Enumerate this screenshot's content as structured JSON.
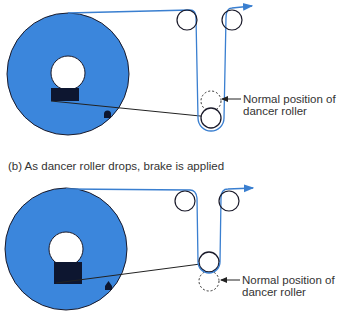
{
  "colors": {
    "reel_fill": "#3b86dc",
    "web_line": "#3a7fd0",
    "outline": "#1a1a2a",
    "brake_block": "#0d1630"
  },
  "panel_a": {
    "dancer_label_line1": "Normal position of",
    "dancer_label_line2": "dancer roller",
    "state": "dancer roller raised above normal position"
  },
  "panel_b": {
    "caption": "(b) As dancer roller drops, brake is applied",
    "dancer_label_line1": "Normal position of",
    "dancer_label_line2": "dancer roller",
    "state": "dancer roller dropped below normal position"
  },
  "icons": {
    "web_direction": "arrow-right-icon"
  }
}
